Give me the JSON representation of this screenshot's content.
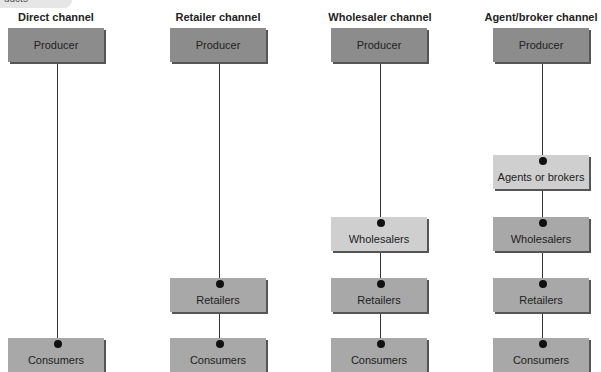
{
  "tag": "ducts",
  "columns": [
    {
      "title": "Direct channel",
      "boxes": [
        "Producer",
        "Consumers"
      ]
    },
    {
      "title": "Retailer channel",
      "boxes": [
        "Producer",
        "Retailers",
        "Consumers"
      ]
    },
    {
      "title": "Wholesaler channel",
      "boxes": [
        "Producer",
        "Wholesalers",
        "Retailers",
        "Consumers"
      ]
    },
    {
      "title": "Agent/broker channel",
      "boxes": [
        "Producer",
        "Agents or brokers",
        "Wholesalers",
        "Retailers",
        "Consumers"
      ]
    }
  ]
}
